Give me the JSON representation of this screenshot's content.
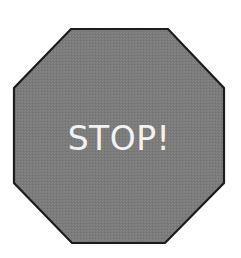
{
  "sign": {
    "shape": "octagon",
    "text": "STOP!",
    "colors": {
      "fill": "#7b7b7b",
      "stroke": "#1c1c1c",
      "text": "#f2f2f2",
      "background": "#ffffff"
    }
  }
}
